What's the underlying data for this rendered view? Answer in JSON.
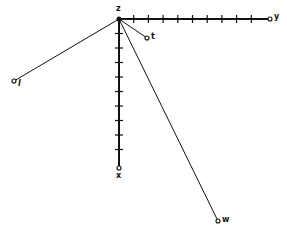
{
  "diagram": {
    "origin": {
      "label": "z",
      "x": 119,
      "y": 19
    },
    "axes": [
      {
        "name": "y-axis",
        "label": "y",
        "end": {
          "x": 270,
          "y": 19
        },
        "ticks": 10
      },
      {
        "name": "x-axis",
        "label": "x",
        "end": {
          "x": 119,
          "y": 168
        },
        "ticks": 10
      }
    ],
    "rays": [
      {
        "name": "ray-t",
        "label": "t",
        "end": {
          "x": 147,
          "y": 38
        }
      },
      {
        "name": "ray-l",
        "label": "l",
        "end": {
          "x": 14,
          "y": 81
        }
      },
      {
        "name": "ray-w",
        "label": "w",
        "end": {
          "x": 218,
          "y": 221
        }
      }
    ],
    "colors": {
      "line": "#111111",
      "background": "#ffffff"
    }
  }
}
